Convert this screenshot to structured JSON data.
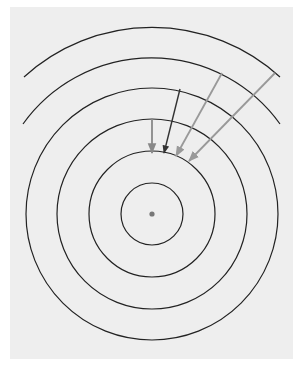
{
  "diagram": {
    "type": "concentric-wavefronts",
    "background_color": "#eeeeee",
    "center": {
      "x": 152,
      "y": 214,
      "dot_radius": 2.6,
      "color": "#777777"
    },
    "line_color": "#222222",
    "full_circles": [
      {
        "r": 31
      },
      {
        "r": 63
      },
      {
        "r": 95
      },
      {
        "r": 126
      }
    ],
    "partial_arcs": [
      {
        "r": 158,
        "start": [
          23,
          124
        ],
        "end": [
          280,
          124
        ]
      },
      {
        "r": 190,
        "start": [
          24,
          77
        ],
        "end": [
          280,
          77
        ]
      }
    ],
    "arrows": [
      {
        "from": [
          152,
          119
        ],
        "to": [
          152,
          153
        ],
        "color": "#888888"
      },
      {
        "from": [
          180,
          89
        ],
        "to": [
          164,
          153
        ],
        "color": "#333333"
      },
      {
        "from": [
          222,
          73
        ],
        "to": [
          176,
          156
        ],
        "color": "#999999"
      },
      {
        "from": [
          275,
          73
        ],
        "to": [
          189,
          161
        ],
        "color": "#999999"
      }
    ]
  }
}
